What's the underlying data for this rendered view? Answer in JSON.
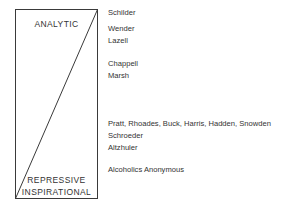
{
  "poles": {
    "top": "ANALYTIC",
    "bottom_line1": "REPRESSIVE",
    "bottom_line2": "INSPIRATIONAL"
  },
  "entries": [
    {
      "label": "Schilder",
      "top": 8
    },
    {
      "label": "Wender",
      "top": 24
    },
    {
      "label": "Lazell",
      "top": 36
    },
    {
      "label": "Chappell",
      "top": 59
    },
    {
      "label": "Marsh",
      "top": 71
    },
    {
      "label": "Pratt, Rhoades, Buck, Harris, Hadden, Snowden",
      "top": 119
    },
    {
      "label": "Schroeder",
      "top": 131
    },
    {
      "label": "Altzhuler",
      "top": 143
    },
    {
      "label": "Alcoholics Anonymous",
      "top": 165
    }
  ],
  "colors": {
    "line": "#3a3a3a",
    "text": "#333333",
    "background": "#ffffff"
  }
}
